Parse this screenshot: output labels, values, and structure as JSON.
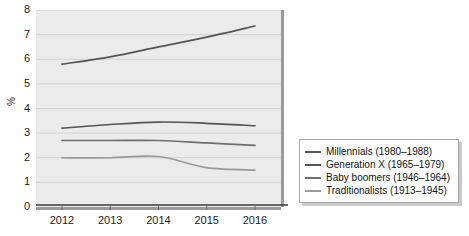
{
  "chart_data": {
    "type": "line",
    "title": "",
    "xlabel": "",
    "ylabel": "%",
    "x": [
      2012,
      2013,
      2014,
      2015,
      2016
    ],
    "categories": [
      "2012",
      "2013",
      "2014",
      "2015",
      "2016"
    ],
    "xlim": [
      2011.7,
      2016.3
    ],
    "ylim": [
      0,
      8
    ],
    "y_ticks": [
      "0",
      "1",
      "2",
      "3",
      "4",
      "5",
      "6",
      "7",
      "8"
    ],
    "grid": true,
    "legend_position": "right",
    "series": [
      {
        "name": "Millennials (1980–1988)",
        "values": [
          5.8,
          6.1,
          6.5,
          6.9,
          7.35
        ],
        "color": "#555555"
      },
      {
        "name": "Generation X (1965–1979)",
        "values": [
          3.2,
          3.35,
          3.45,
          3.4,
          3.3
        ],
        "color": "#555555"
      },
      {
        "name": "Baby boomers (1946–1964)",
        "values": [
          2.7,
          2.7,
          2.7,
          2.6,
          2.5
        ],
        "color": "#6e6e6e"
      },
      {
        "name": "Traditionalists (1913–1945)",
        "values": [
          2.0,
          2.0,
          2.05,
          1.6,
          1.5
        ],
        "color": "#9a9a9a"
      }
    ]
  },
  "axis": {
    "y_label": "%",
    "y_ticks": [
      "8",
      "7",
      "6",
      "5",
      "4",
      "3",
      "2",
      "1",
      "0"
    ],
    "x_ticks": [
      "2012",
      "2013",
      "2014",
      "2015",
      "2016"
    ]
  },
  "legend": {
    "items": [
      {
        "label": "Millennials (1980–1988)",
        "color": "#555555"
      },
      {
        "label": "Generation X (1965–1979)",
        "color": "#555555"
      },
      {
        "label": "Baby boomers (1946–1964)",
        "color": "#6e6e6e"
      },
      {
        "label": "Traditionalists (1913–1945)",
        "color": "#9a9a9a"
      }
    ]
  },
  "style": {
    "plot_background": "#ebebeb",
    "gridline_color": "#d2d2d2",
    "axis_color": "#3a3a3a",
    "legend_border": "#a8a8a8"
  }
}
